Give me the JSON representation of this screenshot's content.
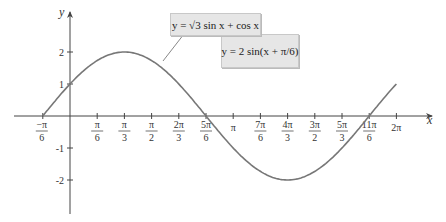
{
  "chart_data": {
    "type": "line",
    "title": "",
    "xlabel": "x",
    "ylabel": "y",
    "xlim_in_pi_over_6": [
      -2,
      13
    ],
    "ylim": [
      -3,
      3
    ],
    "grid": false,
    "x_ticks": [
      {
        "k": -1,
        "num": "−π",
        "den": "6",
        "neg": true
      },
      {
        "k": 1,
        "num": "π",
        "den": "6"
      },
      {
        "k": 2,
        "num": "π",
        "den": "3"
      },
      {
        "k": 3,
        "num": "π",
        "den": "2"
      },
      {
        "k": 4,
        "num": "2π",
        "den": "3"
      },
      {
        "k": 5,
        "num": "5π",
        "den": "6"
      },
      {
        "k": 6,
        "num": "π",
        "den": ""
      },
      {
        "k": 7,
        "num": "7π",
        "den": "6"
      },
      {
        "k": 8,
        "num": "4π",
        "den": "3"
      },
      {
        "k": 9,
        "num": "3π",
        "den": "2"
      },
      {
        "k": 10,
        "num": "5π",
        "den": "3"
      },
      {
        "k": 11,
        "num": "11π",
        "den": "6"
      },
      {
        "k": 12,
        "num": "2π",
        "den": ""
      }
    ],
    "y_ticks": [
      {
        "v": 2,
        "label": "2"
      },
      {
        "v": 1,
        "label": "1"
      },
      {
        "v": -1,
        "label": "-1"
      },
      {
        "v": -2,
        "label": "-2"
      }
    ],
    "series": [
      {
        "name": "y = √3 sin x + cos x = 2 sin(x + π/6)",
        "function": "2*sin(x + pi/6)",
        "x_range": [
          "-π/6",
          "2π"
        ],
        "key_points": [
          {
            "x": "-π/6",
            "y": 0
          },
          {
            "x": "0",
            "y": 1
          },
          {
            "x": "π/3",
            "y": 2
          },
          {
            "x": "5π/6",
            "y": 0
          },
          {
            "x": "4π/3",
            "y": -2
          },
          {
            "x": "11π/6",
            "y": 0
          },
          {
            "x": "2π",
            "y": 1
          }
        ],
        "color": "#777777"
      }
    ],
    "annotations": [
      {
        "text_parts": [
          "y",
          " = √3 sin ",
          "x",
          " + cos ",
          "x"
        ],
        "label": "y = √3 sin x + cos x"
      },
      {
        "label": "y = 2 sin(x + π/6)"
      }
    ]
  },
  "colors": {
    "axis": "#444444",
    "curve": "#777777",
    "legend_bg": "#e6e6e6"
  }
}
